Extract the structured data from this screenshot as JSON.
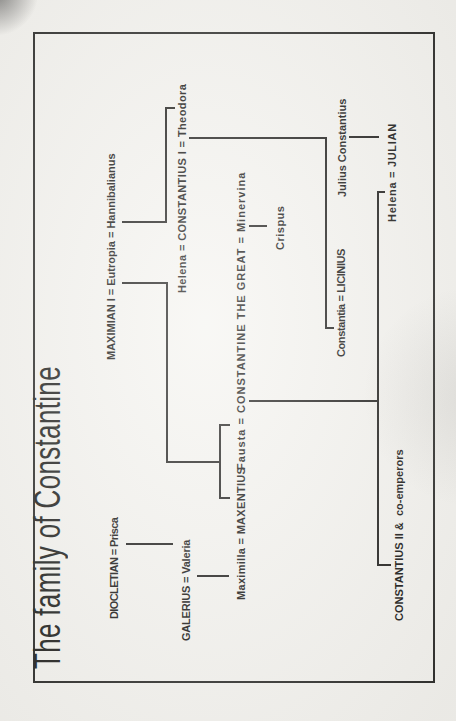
{
  "page": {
    "title": "The family of Constantine",
    "paper_color": "#f5f4f0",
    "ink_color": "#1d1c1a"
  },
  "diagram": {
    "canvas": {
      "width": 721,
      "height": 456,
      "rotation_deg": -90
    },
    "frame": {
      "x": 38,
      "y": 33,
      "width": 647,
      "height": 398
    },
    "title_pos": {
      "x": 52,
      "y": 27
    },
    "nodes": [
      {
        "id": "diocletian-prisca",
        "label": "DIOCLETIAN = Prisca",
        "x": 102,
        "y": 114,
        "ls": -0.6
      },
      {
        "id": "maximian-eutropia",
        "label": "MAXIMIAN I = Eutropia = Hannibalianus",
        "x": 361,
        "y": 111,
        "ls": 0
      },
      {
        "id": "galerius-valeria",
        "label": "GALERIUS = Valeria",
        "x": 80,
        "y": 186,
        "ls": -0.2
      },
      {
        "id": "constantius1",
        "label": "Helena = CONSTANTIUS I = Theodora",
        "x": 428,
        "y": 182,
        "ls": 0.4
      },
      {
        "id": "maximilla-maxentius",
        "label": "Maximilla = MAXENTIUS",
        "x": 121,
        "y": 241,
        "ls": 0.3
      },
      {
        "id": "constantine-great",
        "label": "Fausta = CONSTANTINE THE GREAT = Minervina",
        "x": 251,
        "y": 241,
        "ls": 1.0
      },
      {
        "id": "crispus",
        "label": "Crispus",
        "x": 471,
        "y": 280,
        "ls": 0.5
      },
      {
        "id": "constantia-licinius",
        "label": "Constantia = LICINIUS",
        "x": 364,
        "y": 341,
        "ls": -0.4
      },
      {
        "id": "julius-constantius",
        "label": "Julius Constantius",
        "x": 524,
        "y": 342,
        "ls": 0
      },
      {
        "id": "constantius2",
        "label": "CONSTANTIUS II &  co-emperors",
        "x": 100,
        "y": 399,
        "ls": 0
      },
      {
        "id": "helena-julian",
        "label": "Helena = JULIAN",
        "x": 499,
        "y": 392,
        "ls": 0.7
      }
    ],
    "connectors": [
      {
        "id": "diocletian-to-valeria",
        "points": [
          [
            177,
            126
          ],
          [
            177,
            173
          ]
        ]
      },
      {
        "id": "galerius-to-maximilla",
        "points": [
          [
            145,
            197
          ],
          [
            145,
            229
          ]
        ]
      },
      {
        "id": "maximian-descent",
        "points": [
          [
            438,
            122
          ],
          [
            438,
            167
          ],
          [
            259,
            167
          ],
          [
            259,
            220
          ]
        ]
      },
      {
        "id": "maxentius-fausta-sibling-bar",
        "points": [
          [
            223,
            230
          ],
          [
            223,
            220
          ],
          [
            296,
            220
          ],
          [
            296,
            230
          ]
        ]
      },
      {
        "id": "eutropia-hannibalianus-to-theodora",
        "points": [
          [
            499,
            122
          ],
          [
            499,
            166
          ],
          [
            613,
            166
          ],
          [
            613,
            175
          ]
        ]
      },
      {
        "id": "constantius1-theodora-descent",
        "points": [
          [
            583,
            189
          ],
          [
            583,
            326
          ],
          [
            393,
            326
          ],
          [
            393,
            334
          ]
        ]
      },
      {
        "id": "minervina-to-crispus",
        "points": [
          [
            495,
            249
          ],
          [
            495,
            267
          ]
        ]
      },
      {
        "id": "julius-to-julian",
        "points": [
          [
            584,
            349
          ],
          [
            584,
            379
          ]
        ]
      },
      {
        "id": "constantine-fausta-riser",
        "points": [
          [
            320,
            249
          ],
          [
            320,
            377
          ]
        ]
      },
      {
        "id": "constantine-children-bar",
        "points": [
          [
            156,
            391
          ],
          [
            156,
            378
          ],
          [
            529,
            378
          ],
          [
            529,
            385
          ]
        ]
      }
    ]
  }
}
